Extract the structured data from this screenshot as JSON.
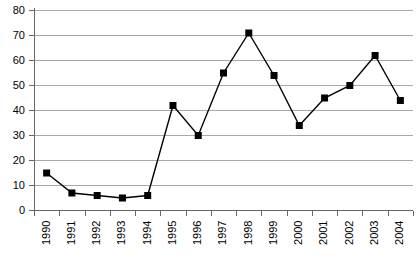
{
  "chart_data": {
    "type": "line",
    "title": "",
    "subtitle": "",
    "xlabel": "",
    "ylabel": "",
    "categories": [
      "1990",
      "1991",
      "1992",
      "1993",
      "1994",
      "1995",
      "1996",
      "1997",
      "1998",
      "1999",
      "2000",
      "2001",
      "2002",
      "2003",
      "2004"
    ],
    "values": [
      15,
      7,
      6,
      5,
      6,
      42,
      30,
      55,
      71,
      54,
      34,
      45,
      50,
      62,
      44
    ],
    "series": [
      {
        "name": "",
        "values": [
          15,
          7,
          6,
          5,
          6,
          42,
          30,
          55,
          71,
          54,
          34,
          45,
          50,
          62,
          44
        ]
      }
    ],
    "ylim": [
      0,
      80
    ],
    "ytick_step": 10,
    "yticks": [
      0,
      10,
      20,
      30,
      40,
      50,
      60,
      70,
      80
    ],
    "ytick_labels": [
      "0",
      "10",
      "20",
      "30",
      "40",
      "50",
      "60",
      "70",
      "80"
    ],
    "grid": "horizontal",
    "legend": "none",
    "marker": "filled-square",
    "line_color": "#000000",
    "marker_color": "#000000",
    "grid_color": "#a8a8a8",
    "axis_color": "#666666",
    "background_color": "#ffffff",
    "xtick_label_rotation": -90
  }
}
